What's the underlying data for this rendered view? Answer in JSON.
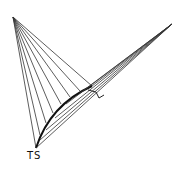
{
  "figure": {
    "label": "TS",
    "colors": {
      "ink": "#222222",
      "background": "#ffffff"
    },
    "points": {
      "apex": [
        13,
        17
      ],
      "base": [
        36,
        148
      ],
      "right_tip": [
        172,
        24
      ]
    }
  }
}
